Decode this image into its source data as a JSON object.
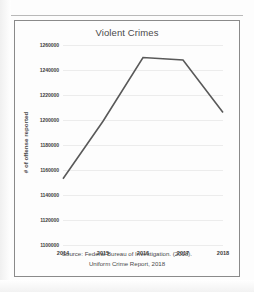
{
  "figure": {
    "title": "Violent Crimes",
    "source_line_1": "Source: Federal Bureau of Investigation. (2018).",
    "source_line_2": "Uniform Crime Report, 2018"
  },
  "chart_data": {
    "type": "line",
    "title": "Violent Crimes",
    "xlabel": "",
    "ylabel": "# of offense reported",
    "categories": [
      "2014",
      "2015",
      "2016",
      "2017",
      "2018"
    ],
    "values": [
      1153000,
      1199000,
      1250000,
      1248000,
      1206000
    ],
    "series": [
      {
        "name": "Violent Crimes",
        "values": [
          1153000,
          1199000,
          1250000,
          1248000,
          1206000
        ],
        "color": "#595959"
      }
    ],
    "ylim": [
      1100000,
      1260000
    ],
    "ytick_values": [
      1260000,
      1240000,
      1220000,
      1200000,
      1180000,
      1160000,
      1140000,
      1120000,
      1100000
    ],
    "ytick_labels": [
      "1260000",
      "1240000",
      "1220000",
      "1200000",
      "1180000",
      "1160000",
      "1140000",
      "1120000",
      "1100000"
    ],
    "xtick_labels": [
      "2014",
      "2015",
      "2016",
      "2017",
      "2018"
    ],
    "grid": true,
    "gridline_color": "#ececec",
    "legend": null,
    "legend_position": "none",
    "annotations": [
      "Source: Federal Bureau of Investigation. (2018).",
      "Uniform Crime Report, 2018"
    ]
  }
}
